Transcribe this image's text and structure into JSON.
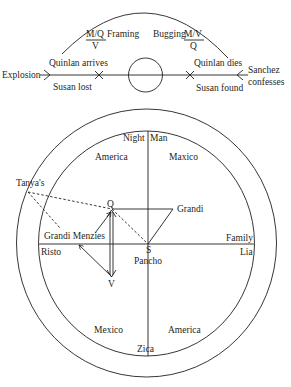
{
  "timeline": {
    "left_label": "Explosion",
    "events_above": [
      "Quinlan arrives",
      "Quinlan dies"
    ],
    "events_below": [
      "Susan lost",
      "Susan found"
    ],
    "right_label_line1": "Sanchez",
    "right_label_line2": "confesses",
    "arc_left": {
      "numerator": "M/Q",
      "denominator": "V",
      "word": "Framing"
    },
    "arc_right": {
      "word": "Bugging",
      "numerator": "M/V",
      "denominator": "Q"
    }
  },
  "circle_diagram": {
    "top_left": "Night",
    "top_right": "Man",
    "bottom": "Zica",
    "left": "Risto",
    "right_above": "Family",
    "right_below": "Lia",
    "quadrants": {
      "upper_left": "America",
      "upper_right": "Maxico",
      "lower_left": "Mexico",
      "lower_right": "America"
    },
    "outside_label": "Tanya's",
    "points": {
      "q": "Q",
      "s": "S",
      "v": "V",
      "grandi": "Grandi",
      "grandi_menzies": "Grandi Menzies",
      "pancho": "Pancho"
    }
  }
}
